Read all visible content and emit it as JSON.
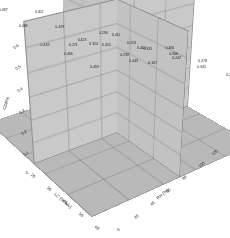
{
  "chart_data": {
    "type": "bar",
    "title": "",
    "xlabel": "LC (% w/v)",
    "ylabel": "RH (%)",
    "zlabel": "CDR%",
    "x_ticks": [
      "20",
      "30",
      "40",
      "50",
      "60"
    ],
    "y_ticks": [
      "0",
      "20",
      "40",
      "60",
      "80",
      "100",
      "120"
    ],
    "z_ticks": [
      "0.6",
      "0.5",
      "0.4",
      "0.3",
      "0.2",
      "0.1",
      "0"
    ],
    "zlim": [
      0,
      0.6
    ],
    "grid": true,
    "legend": "none",
    "categories_x": [
      20,
      30,
      40,
      50,
      60
    ],
    "categories_y": [
      20,
      40,
      60,
      80,
      100
    ],
    "series": [
      {
        "name": "RH 20",
        "values": [
          0.487,
          0.452,
          0.271,
          0.294,
          0.213
        ]
      },
      {
        "name": "RH 40",
        "values": [
          0.468,
          0.429,
          0.324,
          0.239,
          0.167
        ]
      },
      {
        "name": "RH 60",
        "values": [
          0.439,
          0.423,
          0.411,
          0.315,
          0.242
        ]
      },
      {
        "name": "RH 80",
        "values": [
          0.456,
          0.451,
          0.404,
          0.346,
          0.278
        ]
      },
      {
        "name": "RH 100",
        "values": [
          0.459,
          0.443,
          0.456,
          0.345,
          0.271
        ]
      }
    ],
    "bar_labels": [
      [
        "0.487",
        "0.452",
        "0.271",
        "0.294",
        "0.213"
      ],
      [
        "0.468",
        "0.429",
        "0.324",
        "0.239",
        "0.167"
      ],
      [
        "0.439",
        "0.423",
        "0.411",
        "0.315",
        "0.242"
      ],
      [
        "0.456",
        "0.451",
        "0.404",
        "0.346",
        "0.278"
      ],
      [
        "0.459",
        "0.443",
        "0.456",
        "0.345",
        "0.271"
      ]
    ]
  },
  "colors": {
    "figure_background": "#ffffff",
    "floor": "#b9b9b9",
    "wall_left": "#c9c9c9",
    "wall_right": "#c2c2c2",
    "grid_line": "#7d7d7d",
    "bar_dark": "#3a3a3a",
    "bar_light": "#f0f0f0",
    "text": "#1f1f1f"
  }
}
